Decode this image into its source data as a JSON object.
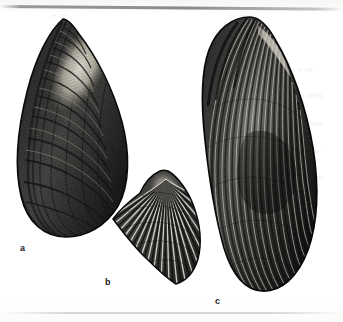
{
  "plate": {
    "title": "Bivalve shell plate",
    "background_color": "#fdfdfc",
    "ink_color": "#101010",
    "medium": "engraving",
    "figures": [
      {
        "id": "a",
        "label": "a",
        "name": "mussel-shell-left",
        "description": "Elongate mussel shell, apex pointed at upper left, broad rounded ventral margin, strong concentric growth lines, pale umbonal region",
        "label_position": {
          "x": 20,
          "y": 244
        },
        "bbox": {
          "x": 14,
          "y": 18,
          "width": 116,
          "height": 220
        }
      },
      {
        "id": "b",
        "label": "b",
        "name": "ribbed-fan-shell-center",
        "description": "Small obliquely fan-shaped shell with strong radiating ribs fanning from a beak at upper right",
        "label_position": {
          "x": 105,
          "y": 278
        },
        "bbox": {
          "x": 110,
          "y": 170,
          "width": 90,
          "height": 115
        }
      },
      {
        "id": "c",
        "label": "c",
        "name": "ribbed-mussel-shell-right",
        "description": "Large elongate horse-mussel shell, rounded dorsal end, fine close-set radiating riblets over the whole surface",
        "label_position": {
          "x": 215,
          "y": 297
        },
        "bbox": {
          "x": 201,
          "y": 16,
          "width": 117,
          "height": 276
        }
      }
    ],
    "artifacts": {
      "top_rule": "faint dark scan line near top edge",
      "bottom_rule": "faint light rule near bottom edge",
      "ghost_text": [
        "e re",
        "n tem",
        "or rust",
        "s tor",
        "em an"
      ]
    }
  }
}
